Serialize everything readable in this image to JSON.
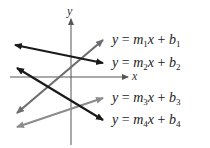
{
  "axes": {
    "x_label": "x",
    "y_label": "y"
  },
  "equations": [
    {
      "lhs": "y",
      "eq": "=",
      "m": "m",
      "m_sub": "1",
      "x": "x",
      "plus": "+",
      "b": "b",
      "b_sub": "1"
    },
    {
      "lhs": "y",
      "eq": "=",
      "m": "m",
      "m_sub": "2",
      "x": "x",
      "plus": "+",
      "b": "b",
      "b_sub": "2"
    },
    {
      "lhs": "y",
      "eq": "=",
      "m": "m",
      "m_sub": "3",
      "x": "x",
      "plus": "+",
      "b": "b",
      "b_sub": "3"
    },
    {
      "lhs": "y",
      "eq": "=",
      "m": "m",
      "m_sub": "4",
      "x": "x",
      "plus": "+",
      "b": "b",
      "b_sub": "4"
    }
  ],
  "lines": [
    {
      "name": "line-1",
      "equation_index": 0,
      "color": "#6e6e6e",
      "x1": 17,
      "y1": 113,
      "x2": 103,
      "y2": 40
    },
    {
      "name": "line-2",
      "equation_index": 1,
      "color": "#1a1a1a",
      "x1": 15,
      "y1": 45,
      "x2": 103,
      "y2": 63
    },
    {
      "name": "line-3",
      "equation_index": 2,
      "color": "#8c8c8c",
      "x1": 17,
      "y1": 127,
      "x2": 103,
      "y2": 98
    },
    {
      "name": "line-4",
      "equation_index": 3,
      "color": "#1a1a1a",
      "x1": 17,
      "y1": 68,
      "x2": 103,
      "y2": 120
    }
  ],
  "colors": {
    "axis": "#555555",
    "text": "#222222",
    "background": "#ffffff"
  }
}
